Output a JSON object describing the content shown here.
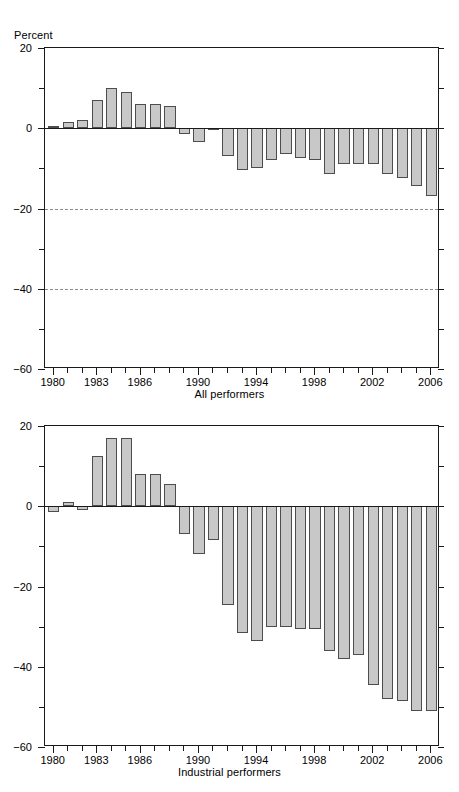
{
  "axis_unit_label": "Percent",
  "colors": {
    "bar_fill": "#c8c8c8",
    "bar_edge": "#4d4d4d",
    "axis": "#1a1a1a",
    "gridline": "#8c8c8c",
    "background": "#ffffff"
  },
  "chart_data": [
    {
      "type": "bar",
      "title": "",
      "subtitle": "",
      "caption": "All performers",
      "xlabel": "All performers",
      "ylabel": "Percent",
      "ylim": [
        -60,
        20
      ],
      "ytick_labels": [
        "20",
        "0",
        "-20",
        "-40",
        "-60"
      ],
      "ytick_values": [
        20,
        0,
        -20,
        -40,
        -60
      ],
      "yminor_values": [
        10,
        -10,
        -30,
        -50
      ],
      "gridlines_at": [
        -20,
        -40
      ],
      "grid": true,
      "legend": "none",
      "xlim": [
        1979.4,
        2006.6
      ],
      "xtick_labels": [
        "1980",
        "1983",
        "1986",
        "1990",
        "1994",
        "1998",
        "2002",
        "2006"
      ],
      "xtick_values": [
        1980,
        1983,
        1986,
        1990,
        1994,
        1998,
        2002,
        2006
      ],
      "xminor_values": [
        1981,
        1982,
        1984,
        1985,
        1987,
        1988,
        1989,
        1991,
        1992,
        1993,
        1995,
        1996,
        1997,
        1999,
        2000,
        2001,
        2003,
        2004,
        2005
      ],
      "categories": [
        1980,
        1981,
        1982,
        1983,
        1984,
        1985,
        1986,
        1987,
        1988,
        1989,
        1990,
        1991,
        1992,
        1993,
        1994,
        1995,
        1996,
        1997,
        1998,
        1999,
        2000,
        2001,
        2002,
        2003,
        2004,
        2005,
        2006
      ],
      "values": [
        0.5,
        1.5,
        2.0,
        7.0,
        10.0,
        9.0,
        6.0,
        6.0,
        5.5,
        -1.5,
        -3.5,
        -0.5,
        -7.0,
        -10.5,
        -10.0,
        -8.0,
        -6.5,
        -7.5,
        -8.0,
        -11.5,
        -9.0,
        -9.0,
        -9.0,
        -11.5,
        -12.5,
        -14.5,
        -17.0
      ]
    },
    {
      "type": "bar",
      "title": "",
      "subtitle": "",
      "caption": "Industrial performers",
      "xlabel": "Industrial performers",
      "ylabel": "Percent",
      "ylim": [
        -60,
        20
      ],
      "ytick_labels": [
        "20",
        "0",
        "-20",
        "-40",
        "-60"
      ],
      "ytick_values": [
        20,
        0,
        -20,
        -40,
        -60
      ],
      "yminor_values": [
        10,
        -10,
        -30,
        -50
      ],
      "gridlines_at": [],
      "grid": false,
      "legend": "none",
      "xlim": [
        1979.4,
        2006.6
      ],
      "xtick_labels": [
        "1980",
        "1983",
        "1986",
        "1990",
        "1994",
        "1998",
        "2002",
        "2006"
      ],
      "xtick_values": [
        1980,
        1983,
        1986,
        1990,
        1994,
        1998,
        2002,
        2006
      ],
      "xminor_values": [
        1981,
        1982,
        1984,
        1985,
        1987,
        1988,
        1989,
        1991,
        1992,
        1993,
        1995,
        1996,
        1997,
        1999,
        2000,
        2001,
        2003,
        2004,
        2005
      ],
      "categories": [
        1980,
        1981,
        1982,
        1983,
        1984,
        1985,
        1986,
        1987,
        1988,
        1989,
        1990,
        1991,
        1992,
        1993,
        1994,
        1995,
        1996,
        1997,
        1998,
        1999,
        2000,
        2001,
        2002,
        2003,
        2004,
        2005,
        2006
      ],
      "values": [
        -1.5,
        1.0,
        -1.0,
        12.5,
        17.0,
        17.0,
        8.0,
        8.0,
        5.5,
        -7.0,
        -12.0,
        -8.5,
        -24.5,
        -31.5,
        -33.5,
        -30.0,
        -30.0,
        -30.5,
        -30.5,
        -36.0,
        -38.0,
        -37.0,
        -44.5,
        -48.0,
        -48.5,
        -51.0,
        -51.0
      ]
    }
  ]
}
